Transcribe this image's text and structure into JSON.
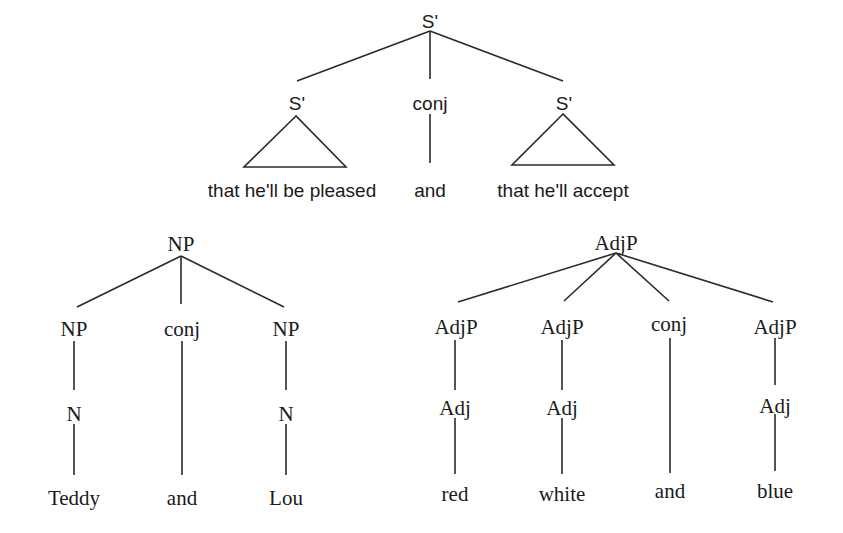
{
  "diagram": {
    "stroke_color": "#2a2a2a",
    "text_color": "#1a1a1a",
    "trees": [
      {
        "id": "s-bar-tree",
        "style": "sans",
        "nodes": [
          {
            "id": "root",
            "label": "S'",
            "x": 430,
            "y": 23
          },
          {
            "id": "left",
            "label": "S'",
            "x": 297,
            "y": 105
          },
          {
            "id": "conj",
            "label": "conj",
            "x": 430,
            "y": 105
          },
          {
            "id": "right",
            "label": "S'",
            "x": 564,
            "y": 105
          },
          {
            "id": "left-text",
            "label": "that he'll be pleased",
            "x": 292,
            "y": 192
          },
          {
            "id": "conj-text",
            "label": "and",
            "x": 430,
            "y": 192
          },
          {
            "id": "right-text",
            "label": "that he'll accept",
            "x": 563,
            "y": 192
          }
        ],
        "edges": [
          [
            430,
            31,
            297,
            81
          ],
          [
            430,
            31,
            430,
            79
          ],
          [
            430,
            31,
            563,
            81
          ],
          [
            430,
            114,
            430,
            163
          ]
        ],
        "triangles": [
          [
            [
              296,
              116
            ],
            [
              244,
              167
            ],
            [
              346,
              167
            ]
          ],
          [
            [
              563,
              114
            ],
            [
              512,
              165
            ],
            [
              614,
              165
            ]
          ]
        ]
      },
      {
        "id": "np-tree",
        "style": "serif",
        "nodes": [
          {
            "id": "root",
            "label": "NP",
            "x": 181,
            "y": 246
          },
          {
            "id": "np1",
            "label": "NP",
            "x": 74,
            "y": 331
          },
          {
            "id": "conj",
            "label": "conj",
            "x": 182,
            "y": 331
          },
          {
            "id": "np2",
            "label": "NP",
            "x": 286,
            "y": 331
          },
          {
            "id": "n1",
            "label": "N",
            "x": 74,
            "y": 416
          },
          {
            "id": "n2",
            "label": "N",
            "x": 286,
            "y": 416
          },
          {
            "id": "w1",
            "label": "Teddy",
            "x": 74,
            "y": 500
          },
          {
            "id": "w2",
            "label": "and",
            "x": 182,
            "y": 500
          },
          {
            "id": "w3",
            "label": "Lou",
            "x": 286,
            "y": 500
          }
        ],
        "edges": [
          [
            181,
            256,
            77,
            307
          ],
          [
            181,
            256,
            181,
            304
          ],
          [
            181,
            256,
            284,
            307
          ],
          [
            74,
            341,
            74,
            390
          ],
          [
            74,
            424,
            74,
            475
          ],
          [
            182,
            341,
            182,
            475
          ],
          [
            286,
            341,
            286,
            390
          ],
          [
            286,
            424,
            286,
            475
          ]
        ]
      },
      {
        "id": "adjp-tree",
        "style": "serif",
        "nodes": [
          {
            "id": "root",
            "label": "AdjP",
            "x": 616,
            "y": 245
          },
          {
            "id": "a1",
            "label": "AdjP",
            "x": 456,
            "y": 329
          },
          {
            "id": "a2",
            "label": "AdjP",
            "x": 562,
            "y": 329
          },
          {
            "id": "conj",
            "label": "conj",
            "x": 669,
            "y": 326
          },
          {
            "id": "a3",
            "label": "AdjP",
            "x": 775,
            "y": 329
          },
          {
            "id": "adj1",
            "label": "Adj",
            "x": 455,
            "y": 410
          },
          {
            "id": "adj2",
            "label": "Adj",
            "x": 562,
            "y": 410
          },
          {
            "id": "adj3",
            "label": "Adj",
            "x": 775,
            "y": 408
          },
          {
            "id": "w1",
            "label": "red",
            "x": 455,
            "y": 496
          },
          {
            "id": "w2",
            "label": "white",
            "x": 562,
            "y": 496
          },
          {
            "id": "w3",
            "label": "and",
            "x": 670,
            "y": 493
          },
          {
            "id": "w4",
            "label": "blue",
            "x": 775,
            "y": 493
          }
        ],
        "edges": [
          [
            616,
            253,
            458,
            302
          ],
          [
            616,
            253,
            564,
            301
          ],
          [
            616,
            253,
            669,
            301
          ],
          [
            616,
            253,
            773,
            302
          ],
          [
            455,
            340,
            455,
            390
          ],
          [
            455,
            418,
            455,
            474
          ],
          [
            562,
            340,
            562,
            390
          ],
          [
            562,
            418,
            562,
            474
          ],
          [
            670,
            338,
            670,
            473
          ],
          [
            775,
            338,
            775,
            385
          ],
          [
            775,
            414,
            775,
            471
          ]
        ]
      }
    ]
  }
}
